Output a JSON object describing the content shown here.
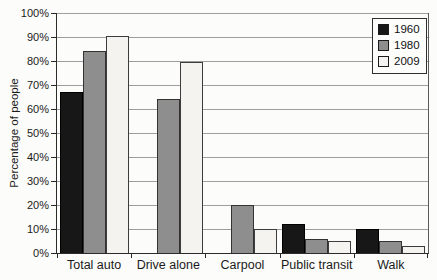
{
  "chart_data": {
    "type": "bar",
    "title": "",
    "xlabel": "",
    "ylabel": "Percentage of people",
    "ylim": [
      0,
      100
    ],
    "ytick_step": 10,
    "ytick_suffix": "%",
    "grid": "horizontal",
    "legend_position": "top-right",
    "categories": [
      "Total auto",
      "Drive alone",
      "Carpool",
      "Public transit",
      "Walk"
    ],
    "series": [
      {
        "name": "1960",
        "fill": "#171717",
        "border": "#000000",
        "values": [
          67,
          null,
          null,
          12,
          10
        ]
      },
      {
        "name": "1980",
        "fill": "#8e8e8e",
        "border": "#333333",
        "values": [
          84,
          64,
          20,
          6,
          5
        ]
      },
      {
        "name": "2009",
        "fill": "#f4f3ef",
        "border": "#3c3c3c",
        "values": [
          90.5,
          79.5,
          10,
          5,
          3
        ]
      }
    ]
  },
  "colors": {
    "gridline": "#9e9e9e",
    "axis": "#2b2b2b",
    "text": "#1b1b1b",
    "background": "#fcfcfa",
    "legend_background": "#fdfdfc"
  }
}
